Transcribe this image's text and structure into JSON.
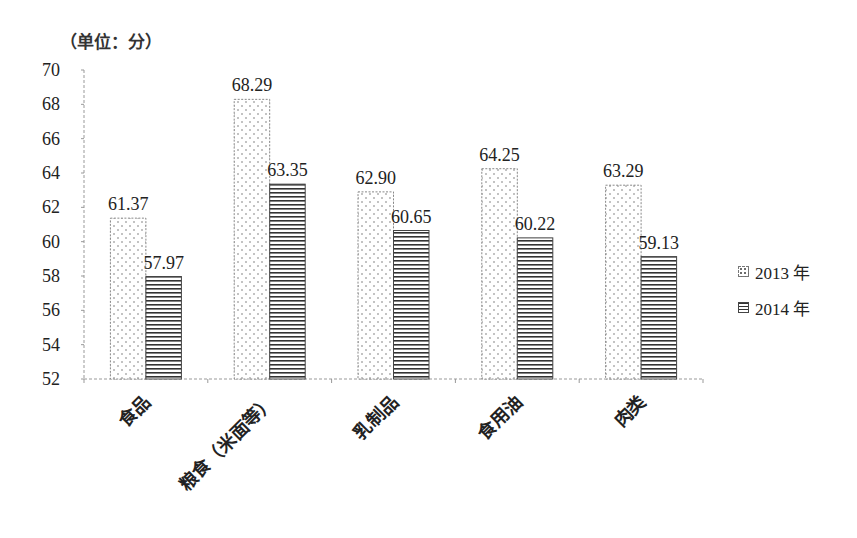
{
  "chart_data": {
    "type": "bar",
    "title": "",
    "unit_label": "（单位：分）",
    "xlabel": "",
    "ylabel": "",
    "categories": [
      "食品",
      "粮食（米面等）",
      "乳制品",
      "食用油",
      "肉类"
    ],
    "series": [
      {
        "name": "2013 年",
        "pattern": "dots",
        "values": [
          61.37,
          68.29,
          62.9,
          64.25,
          63.29
        ],
        "labels": [
          "61.37",
          "68.29",
          "62.90",
          "64.25",
          "63.29"
        ]
      },
      {
        "name": "2014 年",
        "pattern": "horizontal-lines",
        "values": [
          57.97,
          63.35,
          60.65,
          60.22,
          59.13
        ],
        "labels": [
          "57.97",
          "63.35",
          "60.65",
          "60.22",
          "59.13"
        ]
      }
    ],
    "ylim": [
      52,
      70
    ],
    "yticks": [
      52,
      54,
      56,
      58,
      60,
      62,
      64,
      66,
      68,
      70
    ],
    "grid": false,
    "legend_position": "right",
    "x_tick_rotation": "-45deg"
  }
}
